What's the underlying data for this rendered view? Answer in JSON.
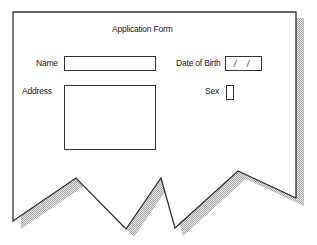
{
  "form": {
    "title": "Application Form",
    "fields": {
      "name": {
        "label": "Name",
        "value": ""
      },
      "date_of_birth": {
        "label": "Date of Birth",
        "value": "/ /"
      },
      "address": {
        "label": "Address",
        "value": ""
      },
      "sex": {
        "label": "Sex",
        "value": ""
      }
    }
  },
  "style": {
    "outline_color": "#333333",
    "shadow_color": "#bbbbbb",
    "background": "#ffffff"
  }
}
